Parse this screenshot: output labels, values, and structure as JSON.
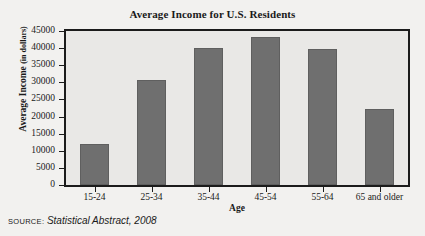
{
  "chart_data": {
    "type": "bar",
    "title": "Average Income for U.S. Residents",
    "xlabel": "Age",
    "ylabel": "Average Income",
    "ylabel_unit": "(in dollars)",
    "ylabel_full": "Average Income (in dollars)",
    "categories": [
      "15-24",
      "25-34",
      "35-44",
      "45-54",
      "55-64",
      "65 and older"
    ],
    "values": [
      11900,
      30800,
      39900,
      43200,
      39700,
      22200
    ],
    "ylim": [
      0,
      45000
    ],
    "ytick_step": 5000,
    "ytick_labels": [
      "45000",
      "40000",
      "35000",
      "30000",
      "25000",
      "20000",
      "15000",
      "10000",
      "5000",
      "0"
    ],
    "ytick_values": [
      45000,
      40000,
      35000,
      30000,
      25000,
      20000,
      15000,
      10000,
      5000,
      0
    ],
    "grid": false,
    "legend": "none",
    "bar_color": "#6f6f6f",
    "plot_background": "#e9e8e6",
    "figure_background": "#f2f1ef",
    "axis_color": "#1b1b1b"
  },
  "source": {
    "label": "SOURCE:",
    "text": "Statistical Abstract, 2008"
  }
}
